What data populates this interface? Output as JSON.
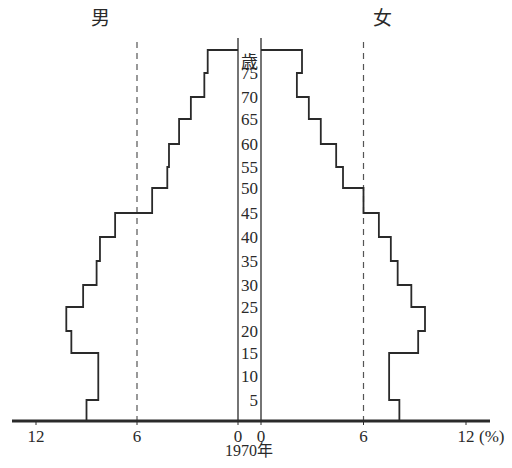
{
  "chart_data": {
    "type": "population_pyramid",
    "title": "1970年",
    "left_label": "男",
    "right_label": "女",
    "age_unit_label": "歳",
    "x_unit": "(%)",
    "xlim": [
      0,
      12
    ],
    "x_ticks": [
      0,
      6,
      12
    ],
    "reference_lines": [
      6
    ],
    "age_groups": [
      "0-4",
      "5-9",
      "10-14",
      "15-19",
      "20-24",
      "25-29",
      "30-34",
      "35-39",
      "40-44",
      "45-49",
      "50-54",
      "55-59",
      "60-64",
      "65-69",
      "70-74",
      "75+"
    ],
    "age_labels": [
      "5",
      "10",
      "15",
      "20",
      "25",
      "30",
      "35",
      "40",
      "45",
      "50",
      "55",
      "60",
      "65",
      "70",
      "75"
    ],
    "series": [
      {
        "name": "男",
        "side": "left",
        "values": [
          9.0,
          8.3,
          8.3,
          9.9,
          10.2,
          9.2,
          8.4,
          8.2,
          7.3,
          5.1,
          4.2,
          4.1,
          3.5,
          2.8,
          2.0,
          1.8
        ]
      },
      {
        "name": "女",
        "side": "right",
        "values": [
          8.1,
          7.5,
          7.5,
          9.2,
          9.6,
          8.8,
          8.0,
          7.6,
          6.9,
          6.0,
          4.8,
          4.4,
          3.5,
          2.8,
          2.1,
          2.4
        ]
      }
    ],
    "grid": false,
    "legend": "none"
  },
  "labels": {
    "male": "男",
    "female": "女",
    "age_unit": "歳",
    "year": "1970年",
    "percent_unit": "(%)"
  },
  "colors": {
    "line": "#2a2a2a",
    "dashed": "#555555",
    "background": "#ffffff"
  }
}
